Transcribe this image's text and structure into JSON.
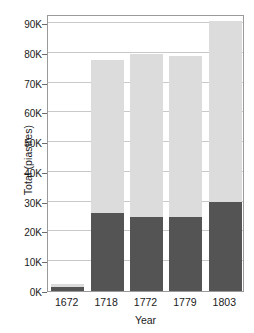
{
  "chart_data": {
    "type": "bar",
    "stacked": true,
    "title": "",
    "xlabel": "Year",
    "ylabel": "Total (piastres)",
    "categories": [
      "1672",
      "1718",
      "1772",
      "1779",
      "1803"
    ],
    "series": [
      {
        "name": "lower",
        "color": "#545454",
        "values": [
          1200,
          26300,
          25000,
          25000,
          30000
        ]
      },
      {
        "name": "upper",
        "color": "#dcdcdc",
        "values": [
          1300,
          51200,
          54500,
          53800,
          60500
        ]
      }
    ],
    "totals": [
      2500,
      77500,
      79500,
      78800,
      90500
    ],
    "ylim": [
      0,
      93000
    ],
    "yticks": [
      0,
      10000,
      20000,
      30000,
      40000,
      50000,
      60000,
      70000,
      80000,
      90000
    ],
    "ytick_labels": [
      "0K",
      "10K",
      "20K",
      "30K",
      "40K",
      "50K",
      "60K",
      "70K",
      "80K",
      "90K"
    ],
    "grid": true,
    "grid_axis": "y",
    "legend": "none",
    "frame_color": "#9a9a9a",
    "grid_color": "#c9c9c9",
    "background": "#ffffff"
  }
}
